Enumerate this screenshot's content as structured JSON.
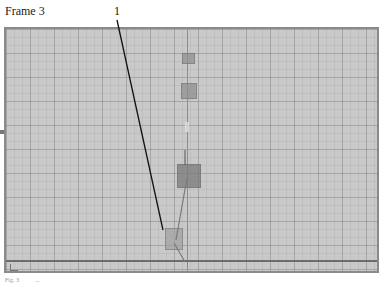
{
  "header": {
    "frame_label": "Frame 3",
    "reference_numeral": "1"
  },
  "viewport": {
    "background_color": "#c9c9c9",
    "grid_color": "#9a9a9a",
    "objects": [
      {
        "name": "top-marker",
        "x": 180,
        "y": 53,
        "w": 12,
        "h": 10
      },
      {
        "name": "upper-box",
        "x": 179,
        "y": 83,
        "w": 15,
        "h": 15
      },
      {
        "name": "middle-box",
        "x": 176,
        "y": 165,
        "w": 22,
        "h": 22
      },
      {
        "name": "bottom-box",
        "x": 163,
        "y": 228,
        "w": 16,
        "h": 20
      }
    ]
  },
  "footer": {
    "caption_left": "Fig. 3",
    "caption_right": "..."
  }
}
